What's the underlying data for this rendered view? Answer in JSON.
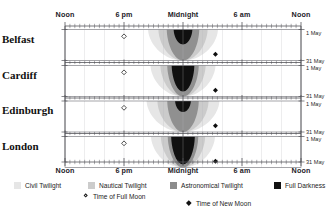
{
  "chart_data": {
    "type": "heatmap",
    "title": "",
    "subtitle": "",
    "xlabel": "",
    "ylabel": "",
    "grid": true,
    "legend_position": "bottom",
    "x_axis": {
      "tick_labels": [
        "Noon",
        "6 pm",
        "Midnight",
        "6 am",
        "Noon"
      ],
      "tick_positions_hours": [
        12,
        18,
        24,
        30,
        36
      ],
      "range_hours": [
        12,
        36
      ],
      "duplicated_top_and_bottom": true
    },
    "y_axis": {
      "panels": [
        "Belfast",
        "Cardiff",
        "Edinburgh",
        "London"
      ],
      "date_range": [
        "1 May",
        "31 May"
      ],
      "right_tick_labels": [
        "1 May",
        "31 May",
        "1 May",
        "31 May",
        "1 May",
        "31 May",
        "1 May",
        "31 May"
      ]
    },
    "bands": [
      {
        "name": "Daylight",
        "color": "#ffffff"
      },
      {
        "name": "Civil Twilight",
        "color": "#e3e3e3"
      },
      {
        "name": "Nautical Twilight",
        "color": "#c5c5c5"
      },
      {
        "name": "Astronomical Twilight",
        "color": "#8e8e8e"
      },
      {
        "name": "Full Darkness",
        "color": "#0d0d0d"
      }
    ],
    "panels": [
      {
        "city": "Belfast",
        "latitude_rank": 2,
        "darkness_depth_frac": 0.46,
        "band_widths_at_midnight_hours": {
          "civil": 7.1,
          "nautical": 5.0,
          "astronomical": 3.3,
          "dark": 1.9
        },
        "full_moon": {
          "hour": 18.0,
          "day_frac": 0.22
        },
        "new_moon": {
          "hour": 27.3,
          "day_frac": 0.8
        }
      },
      {
        "city": "Cardiff",
        "latitude_rank": 4,
        "darkness_depth_frac": 0.8,
        "band_widths_at_midnight_hours": {
          "civil": 6.6,
          "nautical": 4.6,
          "astronomical": 3.2,
          "dark": 2.3
        },
        "full_moon": {
          "hour": 18.0,
          "day_frac": 0.22
        },
        "new_moon": {
          "hour": 27.3,
          "day_frac": 0.8
        }
      },
      {
        "city": "Edinburgh",
        "latitude_rank": 1,
        "darkness_depth_frac": 0.34,
        "band_widths_at_midnight_hours": {
          "civil": 7.4,
          "nautical": 5.2,
          "astronomical": 3.2,
          "dark": 1.6
        },
        "full_moon": {
          "hour": 18.0,
          "day_frac": 0.22
        },
        "new_moon": {
          "hour": 27.3,
          "day_frac": 0.8
        }
      },
      {
        "city": "London",
        "latitude_rank": 3,
        "darkness_depth_frac": 0.86,
        "band_widths_at_midnight_hours": {
          "civil": 6.5,
          "nautical": 4.5,
          "astronomical": 3.1,
          "dark": 2.4
        },
        "full_moon": {
          "hour": 18.0,
          "day_frac": 0.22
        },
        "new_moon": {
          "hour": 27.3,
          "day_frac": 0.8
        }
      }
    ]
  },
  "axis": {
    "hours_top": [
      "Noon",
      "6 pm",
      "Midnight",
      "6 am",
      "Noon"
    ],
    "hours_bottom": [
      "Noon",
      "6 pm",
      "Midnight",
      "6 am",
      "Noon"
    ]
  },
  "cities": [
    {
      "name": "Belfast"
    },
    {
      "name": "Cardiff"
    },
    {
      "name": "Edinburgh"
    },
    {
      "name": "London"
    }
  ],
  "dates": [
    {
      "label": "1 May"
    },
    {
      "label": "31 May"
    },
    {
      "label": "1 May"
    },
    {
      "label": "31 May"
    },
    {
      "label": "1 May"
    },
    {
      "label": "31 May"
    },
    {
      "label": "1 May"
    },
    {
      "label": "31 May"
    }
  ],
  "legend": {
    "bands": [
      {
        "label": "Civil Twilight",
        "color": "#e6e6e6"
      },
      {
        "label": "Nautical Twilight",
        "color": "#cccccc"
      },
      {
        "label": "Astronomical Twilight",
        "color": "#8c8c8c"
      },
      {
        "label": "Full Darkness",
        "color": "#121212"
      }
    ],
    "moons": [
      {
        "label": "Time of Full Moon",
        "marker": "diamond-outline-icon"
      },
      {
        "label": "Time of New Moon",
        "marker": "diamond-filled-icon"
      }
    ]
  },
  "colors": {
    "daylight": "#ffffff",
    "civil": "#e6e6e6",
    "nautical": "#cbcbcb",
    "astronomical": "#909090",
    "dark": "#101010",
    "axis": "#55555a",
    "text": "#1b1b1b"
  }
}
